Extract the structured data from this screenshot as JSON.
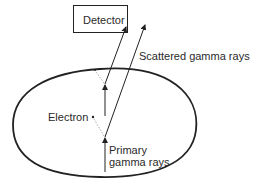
{
  "diagram": {
    "title": "",
    "detector": {
      "label": "Detector"
    },
    "labels": {
      "scattered": "Scattered gamma rays",
      "electron": "Electron",
      "primary_line1": "Primary",
      "primary_line2": "gamma rays"
    },
    "colors": {
      "stroke": "#222222",
      "text": "#2a2a2a",
      "dotted": "#999999",
      "background": "#ffffff"
    }
  }
}
